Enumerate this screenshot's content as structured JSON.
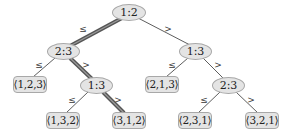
{
  "diagram": {
    "type": "decision-tree",
    "colors": {
      "node_fill": "#e4e4e4",
      "node_border": "#a8a8a8",
      "text": "#222222",
      "edge": "#333333",
      "highlight_edge": "#555555",
      "highlight_edge_core": "#9a9a9a"
    },
    "nodes": [
      {
        "id": "root",
        "label": "1:2",
        "kind": "internal",
        "x": 112,
        "y": 4,
        "w": 34,
        "h": 17
      },
      {
        "id": "n23_left",
        "label": "2:3",
        "kind": "internal",
        "x": 47,
        "y": 43,
        "w": 33,
        "h": 17
      },
      {
        "id": "n13_right",
        "label": "1:3",
        "kind": "internal",
        "x": 179,
        "y": 43,
        "w": 33,
        "h": 17
      },
      {
        "id": "leaf123",
        "label": "⟨1,2,3⟩",
        "kind": "leaf",
        "x": 13,
        "y": 76,
        "w": 34,
        "h": 17
      },
      {
        "id": "n13_mid",
        "label": "1:3",
        "kind": "internal",
        "x": 80,
        "y": 77,
        "w": 33,
        "h": 17
      },
      {
        "id": "leaf213",
        "label": "⟨2,1,3⟩",
        "kind": "leaf",
        "x": 145,
        "y": 76,
        "w": 34,
        "h": 17
      },
      {
        "id": "n23_right",
        "label": "2:3",
        "kind": "internal",
        "x": 212,
        "y": 77,
        "w": 33,
        "h": 17
      },
      {
        "id": "leaf132",
        "label": "⟨1,3,2⟩",
        "kind": "leaf",
        "x": 46,
        "y": 112,
        "w": 34,
        "h": 17
      },
      {
        "id": "leaf312",
        "label": "⟨3,1,2⟩",
        "kind": "leaf",
        "x": 112,
        "y": 112,
        "w": 34,
        "h": 17
      },
      {
        "id": "leaf231",
        "label": "⟨2,3,1⟩",
        "kind": "leaf",
        "x": 178,
        "y": 112,
        "w": 34,
        "h": 17
      },
      {
        "id": "leaf321",
        "label": "⟨3,2,1⟩",
        "kind": "leaf",
        "x": 245,
        "y": 112,
        "w": 34,
        "h": 17
      }
    ],
    "edges": [
      {
        "from": "root",
        "to": "n23_left",
        "label": "≤",
        "x1": 122,
        "y1": 18,
        "x2": 70,
        "y2": 46,
        "lx": 83,
        "ly": 29,
        "highlight": true
      },
      {
        "from": "root",
        "to": "n13_right",
        "label": ">",
        "x1": 138,
        "y1": 18,
        "x2": 190,
        "y2": 45,
        "lx": 168,
        "ly": 29,
        "highlight": false
      },
      {
        "from": "n23_left",
        "to": "leaf123",
        "label": "≤",
        "x1": 55,
        "y1": 58,
        "x2": 33,
        "y2": 77,
        "lx": 39,
        "ly": 65,
        "highlight": false
      },
      {
        "from": "n23_left",
        "to": "n13_mid",
        "label": ">",
        "x1": 70,
        "y1": 58,
        "x2": 92,
        "y2": 79,
        "lx": 86,
        "ly": 65,
        "highlight": true
      },
      {
        "from": "n13_right",
        "to": "leaf213",
        "label": "≤",
        "x1": 188,
        "y1": 58,
        "x2": 166,
        "y2": 77,
        "lx": 172,
        "ly": 65,
        "highlight": false
      },
      {
        "from": "n13_right",
        "to": "n23_right",
        "label": ">",
        "x1": 203,
        "y1": 58,
        "x2": 224,
        "y2": 79,
        "lx": 218,
        "ly": 65,
        "highlight": false
      },
      {
        "from": "n13_mid",
        "to": "leaf132",
        "label": "≤",
        "x1": 88,
        "y1": 92,
        "x2": 66,
        "y2": 113,
        "lx": 72,
        "ly": 100,
        "highlight": false
      },
      {
        "from": "n13_mid",
        "to": "leaf312",
        "label": ">",
        "x1": 103,
        "y1": 92,
        "x2": 124,
        "y2": 113,
        "lx": 118,
        "ly": 100,
        "highlight": true
      },
      {
        "from": "n23_right",
        "to": "leaf231",
        "label": "≤",
        "x1": 220,
        "y1": 92,
        "x2": 198,
        "y2": 113,
        "lx": 204,
        "ly": 100,
        "highlight": false
      },
      {
        "from": "n23_right",
        "to": "leaf321",
        "label": ">",
        "x1": 236,
        "y1": 92,
        "x2": 258,
        "y2": 113,
        "lx": 251,
        "ly": 100,
        "highlight": false
      }
    ]
  }
}
